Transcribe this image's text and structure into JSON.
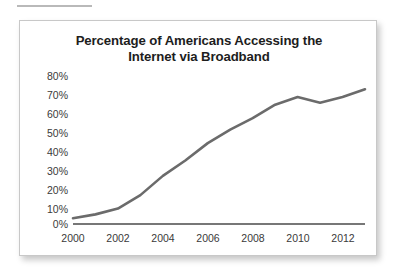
{
  "figure": {
    "rule_name": "top-rule"
  },
  "chart_data": {
    "type": "line",
    "title_line1": "Percentage of Americans Accessing the",
    "title_line2": "Internet via Broadband",
    "title": "Percentage of Americans Accessing the Internet via Broadband",
    "xlabel": "",
    "ylabel": "",
    "xlim": [
      2000,
      2013
    ],
    "ylim": [
      0,
      80
    ],
    "grid": false,
    "legend": "none",
    "line_color": "#6b6b6b",
    "axis_color": "#4a4a4a",
    "x": [
      2000,
      2001,
      2002,
      2003,
      2004,
      2005,
      2006,
      2007,
      2008,
      2009,
      2010,
      2011,
      2012,
      2013
    ],
    "values": [
      3,
      5,
      8,
      15,
      25,
      33,
      42,
      49,
      55,
      62,
      66,
      63,
      66,
      70
    ],
    "xticks": [
      2000,
      2002,
      2004,
      2006,
      2008,
      2010,
      2012
    ],
    "xtick_labels": [
      "2000",
      "2002",
      "2004",
      "2006",
      "2008",
      "2010",
      "2012"
    ],
    "yticks": [
      0,
      10,
      20,
      30,
      40,
      50,
      60,
      70,
      80
    ],
    "ytick_labels": [
      "0%",
      "10%",
      "20%",
      "30%",
      "40%",
      "50%",
      "60%",
      "70%",
      "80%"
    ]
  }
}
